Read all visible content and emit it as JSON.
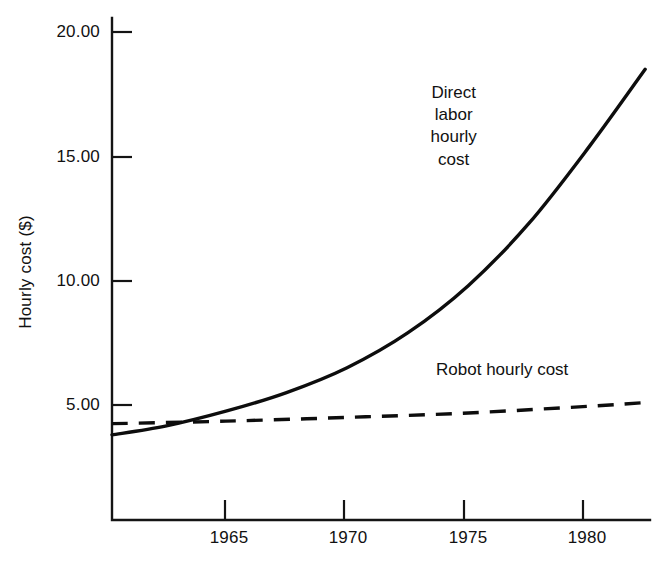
{
  "chart_data": {
    "type": "line",
    "title": "",
    "xlabel": "",
    "ylabel": "Hourly cost ($)",
    "xlim": [
      1960.3,
      1982.5
    ],
    "ylim": [
      0,
      21.0
    ],
    "grid": false,
    "legend": "inline-annotations",
    "x_ticks": [
      1965,
      1970,
      1975,
      1980
    ],
    "x_tick_labels": [
      "1965",
      "1970",
      "1975",
      "1980"
    ],
    "y_ticks": [
      5,
      10,
      15,
      20
    ],
    "y_tick_labels": [
      "5.00",
      "10.00",
      "15.00",
      "20.00"
    ],
    "series": [
      {
        "name": "Direct labor hourly cost",
        "style": "solid",
        "color": "#0d0d0d",
        "x": [
          1960.3,
          1962.5,
          1965,
          1967.5,
          1970,
          1972.5,
          1975,
          1977.5,
          1980,
          1982.3
        ],
        "values": [
          3.8,
          4.15,
          4.75,
          5.5,
          6.5,
          7.9,
          9.8,
          12.3,
          15.4,
          18.5
        ]
      },
      {
        "name": "Robot hourly cost",
        "style": "dashed",
        "color": "#0d0d0d",
        "x": [
          1960.3,
          1965,
          1970,
          1975,
          1980,
          1982.3
        ],
        "values": [
          4.25,
          4.35,
          4.5,
          4.68,
          4.95,
          5.1
        ]
      }
    ],
    "annotations": [
      {
        "name": "direct-labor-label",
        "lines": [
          "Direct",
          "labor",
          "hourly",
          "cost"
        ],
        "x": 1974.4,
        "y": 16.2
      },
      {
        "name": "robot-label",
        "lines": [
          "Robot hourly cost"
        ],
        "x": 1976.4,
        "y": 6.4
      }
    ]
  },
  "axes": {
    "y_title": "Hourly cost ($)"
  }
}
